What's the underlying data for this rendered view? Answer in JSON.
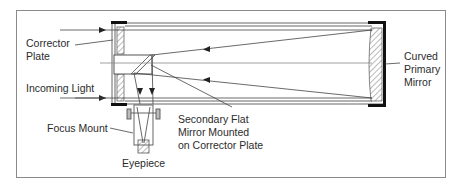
{
  "diagram": {
    "labels": {
      "corrector_plate": [
        "Corrector",
        "Plate"
      ],
      "incoming_light": "Incoming Light",
      "curved_primary_mirror": [
        "Curved",
        "Primary",
        "Mirror"
      ],
      "secondary_mirror": [
        "Secondary Flat",
        "Mirror Mounted",
        "on Corrector Plate"
      ],
      "focus_mount": "Focus Mount",
      "eyepiece": "Eyepiece"
    },
    "colors": {
      "line": "#555555",
      "frame": "#8a8a8a",
      "bracket": "#111111",
      "text": "#2b2b2b",
      "background": "#ffffff"
    }
  }
}
